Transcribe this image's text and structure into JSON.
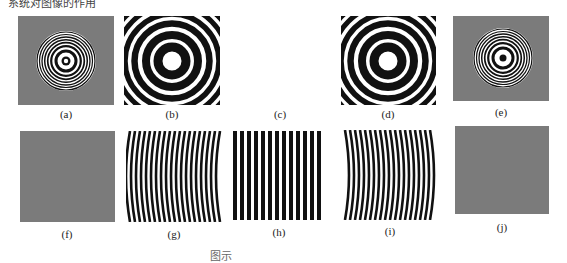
{
  "figure": {
    "top_caption_fragment": "系统对图像的作用",
    "bottom_caption_fragment": "图示",
    "panels": [
      {
        "id": "a",
        "label": "(a)",
        "content": "concentric rings on gray background, white center dot"
      },
      {
        "id": "b",
        "label": "(b)",
        "content": "magnified concentric rings, white center"
      },
      {
        "id": "c",
        "label": "(c)",
        "content": "blank"
      },
      {
        "id": "d",
        "label": "(d)",
        "content": "magnified concentric rings, white center"
      },
      {
        "id": "e",
        "label": "(e)",
        "content": "concentric rings on gray background, black center dot"
      },
      {
        "id": "f",
        "label": "(f)",
        "content": "uniform gray"
      },
      {
        "id": "g",
        "label": "(g)",
        "content": "curved vertical stripes bowing left"
      },
      {
        "id": "h",
        "label": "(h)",
        "content": "straight vertical stripes"
      },
      {
        "id": "i",
        "label": "(i)",
        "content": "curved vertical stripes bowing right"
      },
      {
        "id": "j",
        "label": "(j)",
        "content": "uniform gray"
      }
    ]
  },
  "colors": {
    "gray": "#7b7b7b",
    "black": "#111111",
    "white": "#ffffff"
  }
}
